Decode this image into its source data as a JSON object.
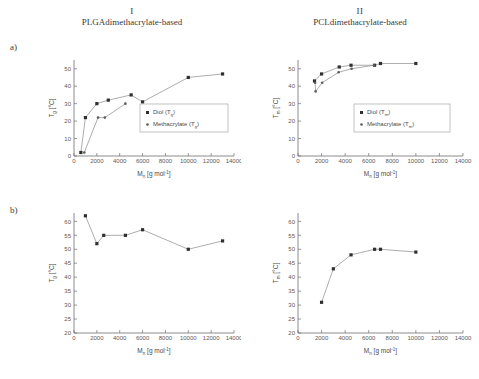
{
  "figure": {
    "columns": [
      {
        "numeral": "I",
        "caption": "PLGAdimethacrylate-based"
      },
      {
        "numeral": "II",
        "caption": "PCLdimethacrylate-based"
      }
    ],
    "row_labels": [
      "a)",
      "b)"
    ]
  },
  "axis_text": {
    "x_title_main": "M",
    "x_title_sub": "n",
    "x_title_unit": "[g  mol",
    "x_title_unit_exp": "-1",
    "x_title_unit_close": "]",
    "y_tg_main": "T",
    "y_tg_sub": "g",
    "y_tm_sub": "m",
    "y_unit": "[°C]"
  },
  "chart_data": [
    {
      "id": "chart-a-I",
      "type": "scatter",
      "title": "",
      "xlabel": "M_n [g mol^-1]",
      "ylabel": "T_g [°C]",
      "xlim": [
        0,
        14000
      ],
      "ylim": [
        0,
        55
      ],
      "xticks": [
        0,
        2000,
        4000,
        6000,
        8000,
        10000,
        12000,
        14000
      ],
      "yticks": [
        0,
        10,
        20,
        30,
        40,
        50
      ],
      "grid": false,
      "legend_position": "center-right",
      "series": [
        {
          "name": "Diol (T_g)",
          "legend_main": "Diol (T",
          "legend_sub": "g",
          "legend_close": ")",
          "marker": "square",
          "points": [
            {
              "x": 600,
              "y": 2
            },
            {
              "x": 1000,
              "y": 22
            },
            {
              "x": 2000,
              "y": 30
            },
            {
              "x": 3000,
              "y": 32
            },
            {
              "x": 5000,
              "y": 35
            },
            {
              "x": 6000,
              "y": 31
            },
            {
              "x": 10000,
              "y": 45
            },
            {
              "x": 13000,
              "y": 47
            }
          ]
        },
        {
          "name": "Methacrylate (T_g)",
          "legend_main": "Methacrylate (T",
          "legend_sub": "g",
          "legend_close": ")",
          "marker": "dot",
          "points": [
            {
              "x": 900,
              "y": 2
            },
            {
              "x": 2100,
              "y": 22
            },
            {
              "x": 2700,
              "y": 22
            },
            {
              "x": 4500,
              "y": 30
            }
          ]
        }
      ]
    },
    {
      "id": "chart-a-II",
      "type": "scatter",
      "title": "",
      "xlabel": "M_n [g mol^-1]",
      "ylabel": "T_m [°C]",
      "xlim": [
        0,
        14000
      ],
      "ylim": [
        0,
        55
      ],
      "xticks": [
        0,
        2000,
        4000,
        6000,
        8000,
        10000,
        12000,
        14000
      ],
      "yticks": [
        0,
        10,
        20,
        30,
        40,
        50
      ],
      "grid": false,
      "legend_position": "center-right",
      "series": [
        {
          "name": "Diol (T_m)",
          "legend_main": "Diol (T",
          "legend_sub": "m",
          "legend_close": ")",
          "marker": "square",
          "points": [
            {
              "x": 1400,
              "y": 43
            },
            {
              "x": 2000,
              "y": 47
            },
            {
              "x": 3500,
              "y": 51
            },
            {
              "x": 4500,
              "y": 52
            },
            {
              "x": 6500,
              "y": 52
            },
            {
              "x": 7000,
              "y": 53
            },
            {
              "x": 10000,
              "y": 53
            }
          ]
        },
        {
          "name": "Methacrylate (T_m)",
          "legend_main": "Methacrylate (T",
          "legend_sub": "m",
          "legend_close": ")",
          "marker": "dot",
          "points": [
            {
              "x": 1500,
              "y": 37
            },
            {
              "x": 1450,
              "y": 42
            },
            {
              "x": 2050,
              "y": 42
            },
            {
              "x": 3450,
              "y": 48
            },
            {
              "x": 4550,
              "y": 50
            },
            {
              "x": 6450,
              "y": 52
            }
          ]
        }
      ]
    },
    {
      "id": "chart-b-I",
      "type": "line",
      "title": "",
      "xlabel": "M_n [g mol^-1]",
      "ylabel": "T_g [°C]",
      "xlim": [
        0,
        14000
      ],
      "ylim": [
        20,
        63
      ],
      "xticks": [
        0,
        2000,
        4000,
        6000,
        8000,
        10000,
        12000,
        14000
      ],
      "yticks": [
        20,
        25,
        30,
        35,
        40,
        45,
        50,
        55,
        60
      ],
      "grid": false,
      "legend_position": "none",
      "series": [
        {
          "name": "T_g",
          "marker": "square",
          "points": [
            {
              "x": 1000,
              "y": 62
            },
            {
              "x": 2000,
              "y": 52
            },
            {
              "x": 2600,
              "y": 55
            },
            {
              "x": 4500,
              "y": 55
            },
            {
              "x": 6000,
              "y": 57
            },
            {
              "x": 10000,
              "y": 50
            },
            {
              "x": 13000,
              "y": 53
            }
          ]
        }
      ]
    },
    {
      "id": "chart-b-II",
      "type": "line",
      "title": "",
      "xlabel": "M_n [g mol^-1]",
      "ylabel": "T_m [°C]",
      "xlim": [
        0,
        14000
      ],
      "ylim": [
        20,
        63
      ],
      "xticks": [
        0,
        2000,
        4000,
        6000,
        8000,
        10000,
        12000,
        14000
      ],
      "yticks": [
        20,
        25,
        30,
        35,
        40,
        45,
        50,
        55,
        60
      ],
      "grid": false,
      "legend_position": "none",
      "series": [
        {
          "name": "T_m",
          "marker": "square",
          "points": [
            {
              "x": 2000,
              "y": 31
            },
            {
              "x": 3000,
              "y": 43
            },
            {
              "x": 4500,
              "y": 48
            },
            {
              "x": 6500,
              "y": 50
            },
            {
              "x": 7000,
              "y": 50
            },
            {
              "x": 10000,
              "y": 49
            }
          ]
        }
      ]
    }
  ]
}
